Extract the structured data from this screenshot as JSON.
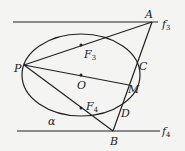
{
  "diagram": {
    "type": "geometry-ellipse-tangent-lines",
    "ellipse": {
      "label": "α",
      "cx": 81,
      "cy": 75,
      "rx": 59,
      "ry": 41
    },
    "lines": [
      {
        "name": "f3",
        "label": "f",
        "sub": "3",
        "y": 22
      },
      {
        "name": "f4",
        "label": "f",
        "sub": "4",
        "y": 131
      }
    ],
    "points": {
      "A": {
        "label": "A",
        "x": 152,
        "y": 22
      },
      "B": {
        "label": "B",
        "x": 113,
        "y": 131
      },
      "C": {
        "label": "C",
        "x": 138,
        "y": 61
      },
      "D": {
        "label": "D",
        "x": 121,
        "y": 105
      },
      "M": {
        "label": "M",
        "x": 129,
        "y": 85
      },
      "O": {
        "label": "O",
        "x": 81,
        "y": 75
      },
      "P": {
        "label": "P",
        "x": 24,
        "y": 65
      },
      "F3": {
        "label": "F",
        "sub": "3",
        "x": 81,
        "y": 45
      },
      "F4": {
        "label": "F",
        "sub": "4",
        "x": 81,
        "y": 108
      }
    },
    "segments": [
      "PA",
      "PB",
      "PM",
      "AB"
    ]
  }
}
